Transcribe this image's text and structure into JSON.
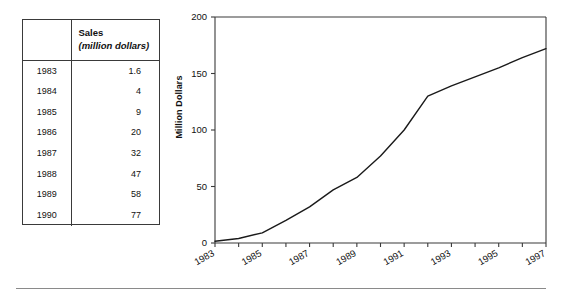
{
  "table": {
    "header": {
      "year_column": "",
      "sales_title": "Sales",
      "sales_units": "(million dollars)"
    },
    "rows": [
      {
        "year": "1983",
        "sales": "1.6"
      },
      {
        "year": "1984",
        "sales": "4"
      },
      {
        "year": "1985",
        "sales": "9"
      },
      {
        "year": "1986",
        "sales": "20"
      },
      {
        "year": "1987",
        "sales": "32"
      },
      {
        "year": "1988",
        "sales": "47"
      },
      {
        "year": "1989",
        "sales": "58"
      },
      {
        "year": "1990",
        "sales": "77"
      }
    ]
  },
  "chart_data": {
    "type": "line",
    "title": "",
    "xlabel": "",
    "ylabel": "Million Dollars",
    "ylim": [
      0,
      200
    ],
    "xlim": [
      1983,
      1997
    ],
    "yticks": [
      0,
      50,
      100,
      150,
      200
    ],
    "ytick_labels": [
      "0",
      "50",
      "100",
      "150",
      "200"
    ],
    "xticks": [
      1983,
      1984,
      1985,
      1986,
      1987,
      1988,
      1989,
      1990,
      1991,
      1992,
      1993,
      1994,
      1995,
      1996,
      1997
    ],
    "xtick_labels_shown": [
      "1983",
      "1985",
      "1987",
      "1989",
      "1991",
      "1993",
      "1995",
      "1997"
    ],
    "grid": false,
    "legend": null,
    "line_color": "#1a1a1a",
    "x": [
      1983,
      1984,
      1985,
      1986,
      1987,
      1988,
      1989,
      1990,
      1991,
      1992,
      1993,
      1994,
      1995,
      1996,
      1997
    ],
    "values": [
      1.6,
      4,
      9,
      20,
      32,
      47,
      58,
      77,
      100,
      130,
      139,
      147,
      155,
      164,
      172
    ],
    "series": [
      {
        "name": "Sales",
        "values": [
          1.6,
          4,
          9,
          20,
          32,
          47,
          58,
          77,
          100,
          130,
          139,
          147,
          155,
          164,
          172
        ]
      }
    ]
  },
  "colors": {
    "line": "#1a1a1a",
    "axis": "#3a3a3a",
    "rule": "#8a8a8a",
    "text": "#111111"
  }
}
